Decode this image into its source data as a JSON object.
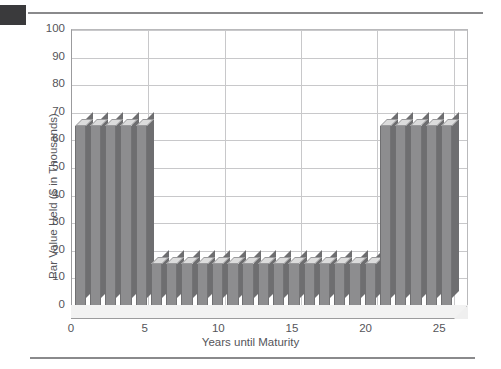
{
  "page": {
    "corner_mark": "black-square-marker",
    "rule_top": "horizontal-rule",
    "rule_bottom": "horizontal-rule"
  },
  "chart_data": {
    "type": "bar",
    "title": "",
    "xlabel": "Years until Maturity",
    "ylabel": "Par Value Held ($ in Thousands)",
    "xlim": [
      0,
      26
    ],
    "ylim": [
      0,
      100
    ],
    "ytick_labels": [
      "0",
      "10",
      "20",
      "30",
      "40",
      "50",
      "60",
      "70",
      "80",
      "90",
      "100"
    ],
    "ytick_values": [
      0,
      10,
      20,
      30,
      40,
      50,
      60,
      70,
      80,
      90,
      100
    ],
    "xtick_labels": [
      "0",
      "5",
      "10",
      "15",
      "20",
      "25"
    ],
    "xtick_values": [
      0,
      5,
      10,
      15,
      20,
      25
    ],
    "grid": "horizontal-and-vertical",
    "legend": "none",
    "bar_style": "3d-column",
    "bar_color": "#8d8d8f",
    "bar_top_color": "#dcdcdc",
    "bar_side_color": "#6e6e70",
    "categories": [
      1,
      2,
      3,
      4,
      5,
      6,
      7,
      8,
      9,
      10,
      11,
      12,
      13,
      14,
      15,
      16,
      17,
      18,
      19,
      20,
      21,
      22,
      23,
      24,
      25
    ],
    "values": [
      65,
      65,
      65,
      65,
      65,
      15,
      15,
      15,
      15,
      15,
      15,
      15,
      15,
      15,
      15,
      15,
      15,
      15,
      15,
      15,
      65,
      65,
      65,
      65,
      65
    ],
    "series": [
      {
        "name": "Par Value Held",
        "values": [
          65,
          65,
          65,
          65,
          65,
          15,
          15,
          15,
          15,
          15,
          15,
          15,
          15,
          15,
          15,
          15,
          15,
          15,
          15,
          15,
          65,
          65,
          65,
          65,
          65
        ]
      }
    ]
  }
}
